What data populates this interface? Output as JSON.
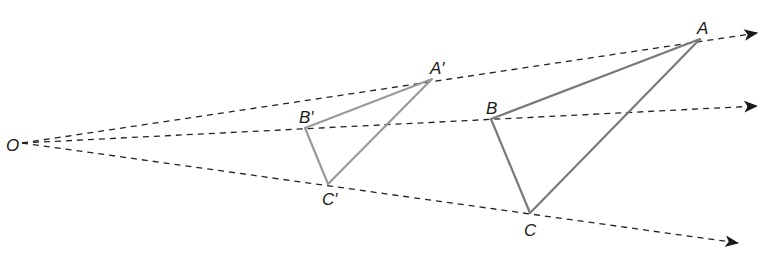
{
  "diagram": {
    "center": {
      "label": "O",
      "x": 22,
      "y": 143,
      "label_x": 6,
      "label_y": 151
    },
    "rays": [
      {
        "name": "ray-to-A",
        "end": [
          757,
          33
        ]
      },
      {
        "name": "ray-to-B",
        "end": [
          757,
          106
        ]
      },
      {
        "name": "ray-to-C",
        "end": [
          738,
          243
        ]
      }
    ],
    "image_triangle": {
      "vertices": [
        {
          "label": "A′",
          "x": 432,
          "y": 79,
          "lx": 430,
          "ly": 74
        },
        {
          "label": "B′",
          "x": 305,
          "y": 128,
          "lx": 299,
          "ly": 123
        },
        {
          "label": "C′",
          "x": 328,
          "y": 184,
          "lx": 322,
          "ly": 205
        }
      ],
      "color": "#9a9a9a"
    },
    "original_triangle": {
      "vertices": [
        {
          "label": "A",
          "x": 700,
          "y": 39,
          "lx": 697,
          "ly": 34
        },
        {
          "label": "B",
          "x": 491,
          "y": 119,
          "lx": 486,
          "ly": 114
        },
        {
          "label": "C",
          "x": 530,
          "y": 213,
          "lx": 524,
          "ly": 236
        }
      ],
      "color": "#7a7a7a"
    },
    "ray_color": "#222222"
  }
}
